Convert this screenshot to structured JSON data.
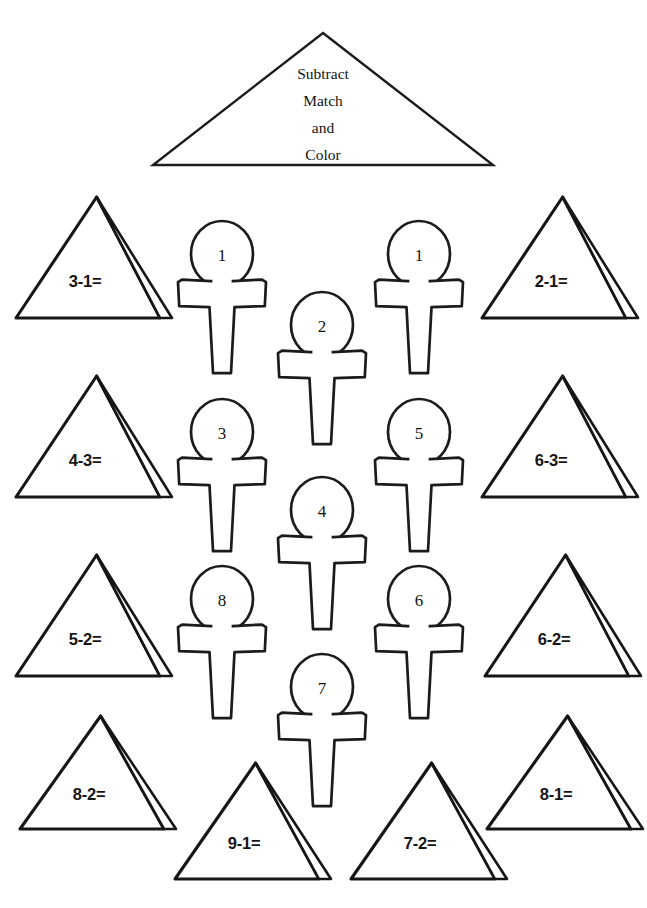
{
  "worksheet": {
    "title_lines": [
      "Subtract",
      "Match",
      "and",
      "Color"
    ],
    "ink_color": "#1b1b1b",
    "paper_color": "#ffffff"
  },
  "title_banner": {
    "name": "title-pyramid",
    "shape": "wide-triangle",
    "cx": 323,
    "apex_y": 33,
    "base_y": 165,
    "half_width": 170,
    "text_x": 323,
    "text_start_y": 79,
    "line_height": 27
  },
  "pyramids": [
    {
      "id": "p1",
      "equation": "3-1=",
      "cx": 88,
      "base_y": 318,
      "apex_y": 197,
      "half_width": 72,
      "face_depth": 12,
      "text_x": 85,
      "text_y": 287
    },
    {
      "id": "p2",
      "equation": "2-1=",
      "cx": 554,
      "base_y": 318,
      "apex_y": 197,
      "half_width": 72,
      "face_depth": 12,
      "text_x": 551,
      "text_y": 287
    },
    {
      "id": "p3",
      "equation": "4-3=",
      "cx": 88,
      "base_y": 497,
      "apex_y": 376,
      "half_width": 72,
      "face_depth": 12,
      "text_x": 85,
      "text_y": 466
    },
    {
      "id": "p4",
      "equation": "6-3=",
      "cx": 554,
      "base_y": 497,
      "apex_y": 376,
      "half_width": 72,
      "face_depth": 12,
      "text_x": 551,
      "text_y": 466
    },
    {
      "id": "p5",
      "equation": "5-2=",
      "cx": 88,
      "base_y": 676,
      "apex_y": 555,
      "half_width": 72,
      "face_depth": 12,
      "text_x": 85,
      "text_y": 645
    },
    {
      "id": "p6",
      "equation": "6-2=",
      "cx": 557,
      "base_y": 676,
      "apex_y": 555,
      "half_width": 72,
      "face_depth": 12,
      "text_x": 554,
      "text_y": 645
    },
    {
      "id": "p7",
      "equation": "8-2=",
      "cx": 92,
      "base_y": 829,
      "apex_y": 716,
      "half_width": 72,
      "face_depth": 12,
      "text_x": 89,
      "text_y": 800
    },
    {
      "id": "p8",
      "equation": "8-1=",
      "cx": 559,
      "base_y": 829,
      "apex_y": 716,
      "half_width": 72,
      "face_depth": 12,
      "text_x": 556,
      "text_y": 800
    },
    {
      "id": "p9",
      "equation": "9-1=",
      "cx": 247,
      "base_y": 879,
      "apex_y": 763,
      "half_width": 72,
      "face_depth": 12,
      "text_x": 244,
      "text_y": 849
    },
    {
      "id": "p10",
      "equation": "7-2=",
      "cx": 423,
      "base_y": 879,
      "apex_y": 763,
      "half_width": 72,
      "face_depth": 12,
      "text_x": 420,
      "text_y": 849
    }
  ],
  "ankhs": [
    {
      "id": "a1",
      "number": "1",
      "cx": 222,
      "top_y": 221,
      "scale": 1.0
    },
    {
      "id": "a2",
      "number": "1",
      "cx": 419,
      "top_y": 221,
      "scale": 1.0
    },
    {
      "id": "a3",
      "number": "2",
      "cx": 322,
      "top_y": 292,
      "scale": 1.0
    },
    {
      "id": "a4",
      "number": "3",
      "cx": 222,
      "top_y": 399,
      "scale": 1.0
    },
    {
      "id": "a5",
      "number": "5",
      "cx": 419,
      "top_y": 399,
      "scale": 1.0
    },
    {
      "id": "a6",
      "number": "4",
      "cx": 322,
      "top_y": 477,
      "scale": 1.0
    },
    {
      "id": "a7",
      "number": "8",
      "cx": 222,
      "top_y": 566,
      "scale": 1.0
    },
    {
      "id": "a8",
      "number": "6",
      "cx": 419,
      "top_y": 566,
      "scale": 1.0
    },
    {
      "id": "a9",
      "number": "7",
      "cx": 322,
      "top_y": 654,
      "scale": 1.0
    }
  ],
  "answer_key": {
    "3-1=": 2,
    "2-1=": 1,
    "4-3=": 1,
    "6-3=": 3,
    "5-2=": 3,
    "6-2=": 4,
    "8-2=": 6,
    "8-1=": 7,
    "9-1=": 8,
    "7-2=": 5
  }
}
